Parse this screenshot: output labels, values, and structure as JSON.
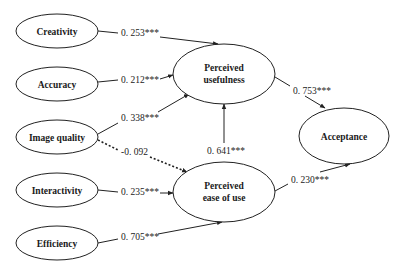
{
  "diagram": {
    "type": "structural-equation-model",
    "nodes": [
      {
        "id": "creativity",
        "label": "Creativity"
      },
      {
        "id": "accuracy",
        "label": "Accuracy"
      },
      {
        "id": "image_quality",
        "label": "Image quality"
      },
      {
        "id": "interactivity",
        "label": "Interactivity"
      },
      {
        "id": "efficiency",
        "label": "Efficiency"
      },
      {
        "id": "pu",
        "label_line1": "Perceived",
        "label_line2": "usefulness"
      },
      {
        "id": "peou",
        "label_line1": "Perceived",
        "label_line2": "ease of use"
      },
      {
        "id": "acceptance",
        "label": "Acceptance"
      }
    ],
    "edges": [
      {
        "from": "creativity",
        "to": "pu",
        "coef": "0. 253***",
        "style": "solid"
      },
      {
        "from": "accuracy",
        "to": "pu",
        "coef": "0. 212***",
        "style": "solid"
      },
      {
        "from": "image_quality",
        "to": "pu",
        "coef": "0. 338***",
        "style": "solid"
      },
      {
        "from": "image_quality",
        "to": "peou",
        "coef": "-0. 092",
        "style": "dashed"
      },
      {
        "from": "interactivity",
        "to": "peou",
        "coef": "0. 235***",
        "style": "solid"
      },
      {
        "from": "efficiency",
        "to": "peou",
        "coef": "0. 705***",
        "style": "solid"
      },
      {
        "from": "peou",
        "to": "pu",
        "coef": "0. 641***",
        "style": "solid"
      },
      {
        "from": "pu",
        "to": "acceptance",
        "coef": "0. 753***",
        "style": "solid"
      },
      {
        "from": "peou",
        "to": "acceptance",
        "coef": "0. 230***",
        "style": "solid"
      }
    ]
  }
}
